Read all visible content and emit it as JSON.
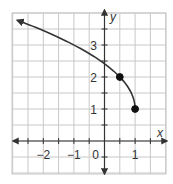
{
  "chart_data": {
    "type": "line",
    "title": "",
    "xlabel": "x",
    "ylabel": "y",
    "xlim": [
      -3,
      2
    ],
    "ylim": [
      -1,
      4.2
    ],
    "grid": true,
    "grid_step": 0.5,
    "x_ticks": [
      {
        "value": -2,
        "label": "−2"
      },
      {
        "value": -1,
        "label": "−1"
      },
      {
        "value": 0,
        "label": "0"
      },
      {
        "value": 1,
        "label": "1"
      }
    ],
    "y_ticks": [
      {
        "value": 1,
        "label": "1"
      },
      {
        "value": 2,
        "label": "2"
      },
      {
        "value": 3,
        "label": "3"
      }
    ],
    "series": [
      {
        "name": "curve",
        "description": "Decreasing curve from upper-left arrow to closed endpoint at (1, 1); approximately y = 1 + sqrt(2(1 - x))",
        "x": [
          -2.85,
          -2.5,
          -2,
          -1.5,
          -1,
          -0.5,
          0,
          0.25,
          0.5,
          0.75,
          0.9,
          1
        ],
        "y": [
          3.79,
          3.65,
          3.45,
          3.24,
          3.0,
          2.73,
          2.41,
          2.22,
          2.0,
          1.71,
          1.45,
          1.0
        ],
        "arrow_start": true
      }
    ],
    "points": [
      {
        "x": 0.5,
        "y": 2,
        "filled": true
      },
      {
        "x": 1,
        "y": 1,
        "filled": true
      }
    ]
  }
}
